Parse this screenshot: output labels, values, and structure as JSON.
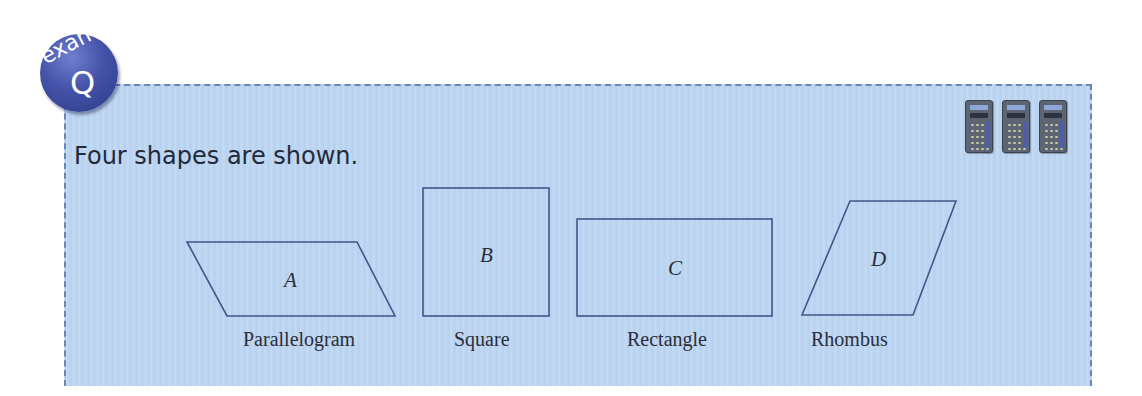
{
  "badge": {
    "word": "exam",
    "letter": "Q"
  },
  "question": {
    "text": "Four shapes are shown."
  },
  "calculator_icons": {
    "count": 3,
    "meaning": "calculator-allowed"
  },
  "shapes": [
    {
      "letter": "A",
      "name": "Parallelogram"
    },
    {
      "letter": "B",
      "name": "Square"
    },
    {
      "letter": "C",
      "name": "Rectangle"
    },
    {
      "letter": "D",
      "name": "Rhombus"
    }
  ],
  "colors": {
    "box_background": "#bcd6f3",
    "border": "#6a86b5",
    "shape_stroke": "#3f5788",
    "badge": "#4453a8"
  }
}
